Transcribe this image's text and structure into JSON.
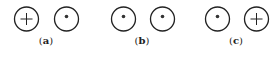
{
  "panels": [
    {
      "label_open": "(",
      "letter": "a",
      "label_close": ")",
      "label_x": 46,
      "symbols": [
        {
          "type": "cross",
          "cx": 26.5,
          "cy": 19
        },
        {
          "type": "dot",
          "cx": 66.5,
          "cy": 19
        }
      ]
    },
    {
      "label_open": "(",
      "letter": "b",
      "label_close": ")",
      "label_x": 142,
      "symbols": [
        {
          "type": "dot",
          "cx": 123.5,
          "cy": 19
        },
        {
          "type": "dot",
          "cx": 162.5,
          "cy": 19
        }
      ]
    },
    {
      "label_open": "(",
      "letter": "c",
      "label_close": ")",
      "label_x": 236,
      "symbols": [
        {
          "type": "dot",
          "cx": 217.5,
          "cy": 19
        },
        {
          "type": "cross",
          "cx": 256.5,
          "cy": 19
        }
      ]
    }
  ],
  "style": {
    "stroke": "#222222",
    "radius": 12
  }
}
